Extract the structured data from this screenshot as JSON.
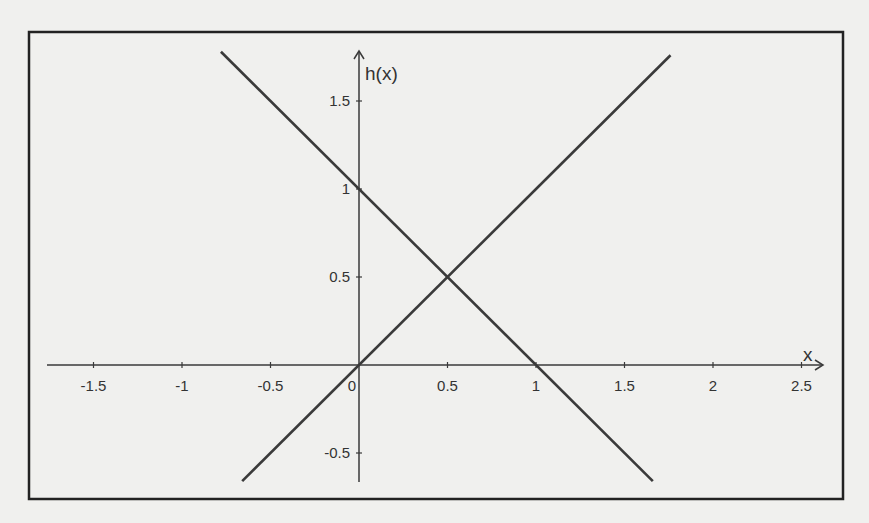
{
  "chart_data": {
    "type": "line",
    "title": "",
    "xlabel": "x",
    "ylabel": "h(x)",
    "xlim": [
      -1.75,
      2.6
    ],
    "ylim": [
      -0.67,
      1.79
    ],
    "grid": false,
    "legend": null,
    "x_ticks": [
      -1.5,
      -1,
      -0.5,
      0,
      0.5,
      1,
      1.5,
      2,
      2.5
    ],
    "x_tick_labels": [
      "-1.5",
      "-1",
      "-0.5",
      "0",
      "0.5",
      "1",
      "1.5",
      "2",
      "2.5"
    ],
    "y_ticks": [
      -0.5,
      0.5,
      1,
      1.5
    ],
    "y_tick_labels": [
      "-0.5",
      "0.5",
      "1",
      "1.5"
    ],
    "series": [
      {
        "name": "ascending line (h(x) = x)",
        "x": [
          -0.66,
          1.76
        ],
        "y": [
          -0.66,
          1.76
        ],
        "color": "#3a3a3a"
      },
      {
        "name": "descending line (h(x) = 1 - x)",
        "x": [
          -0.78,
          1.66
        ],
        "y": [
          1.78,
          -0.66
        ],
        "color": "#3a3a3a"
      }
    ],
    "annotations": [
      {
        "type": "intersection",
        "x": 0.5,
        "y": 0.5
      }
    ]
  },
  "plot": {
    "frame_color": "#222222",
    "axis_color": "#3a3a3a",
    "background": "#f0f0ee",
    "origin_px": [
      359,
      365
    ],
    "px_per_unit_x": 177,
    "px_per_unit_y": 176
  }
}
